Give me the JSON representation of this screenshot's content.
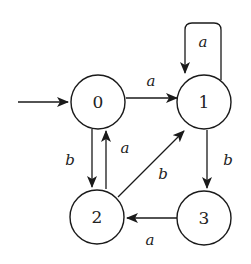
{
  "diagram": {
    "type": "finite-automaton",
    "start_state": "0",
    "states": [
      {
        "id": "0",
        "label": "0"
      },
      {
        "id": "1",
        "label": "1"
      },
      {
        "id": "2",
        "label": "2"
      },
      {
        "id": "3",
        "label": "3"
      }
    ],
    "transitions": [
      {
        "from": "0",
        "to": "1",
        "label": "a"
      },
      {
        "from": "1",
        "to": "1",
        "label": "a"
      },
      {
        "from": "0",
        "to": "2",
        "label": "b"
      },
      {
        "from": "2",
        "to": "0",
        "label": "a"
      },
      {
        "from": "2",
        "to": "1",
        "label": "b"
      },
      {
        "from": "1",
        "to": "3",
        "label": "b"
      },
      {
        "from": "3",
        "to": "2",
        "label": "a"
      }
    ]
  }
}
